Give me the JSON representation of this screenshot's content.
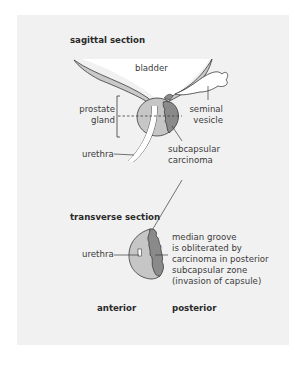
{
  "sagittal": {
    "title": "sagittal section",
    "labels": {
      "bladder": "bladder",
      "prostate_gland": "prostate\ngland",
      "seminal_vesicle": "seminal\nvesicle",
      "urethra": "urethra",
      "subcapsular_carcinoma": "subcapsular\ncarcinoma"
    }
  },
  "transverse": {
    "title": "transverse section",
    "labels": {
      "urethra": "urethra",
      "note": "median groove\nis obliterated by\ncarcinoma in posterior\nsubcapsular zone\n(invasion of capsule)"
    },
    "orientation": {
      "anterior": "anterior",
      "posterior": "posterior"
    }
  },
  "colors": {
    "panel_bg": "#f1f1f1",
    "bladder_fill": "#ffffff",
    "gland_fill": "#c6c6c6",
    "carcinoma_fill": "#8a8a8a",
    "outline": "#3a3a3a"
  }
}
